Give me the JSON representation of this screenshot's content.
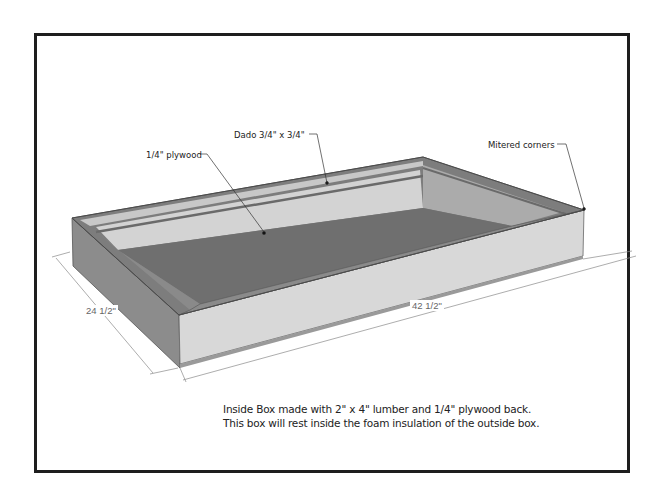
{
  "diagram": {
    "type": "3d-box-sketch",
    "subject": "Inside box",
    "colors": {
      "frame": "#1e1e1e",
      "floor": "#6e6e6e",
      "inner_wall_light": "#d2d2d2",
      "inner_wall_right": "#a9a9a9",
      "outer_front_face": "#d6d6d6",
      "outer_left_face": "#8a8a8a",
      "rim": "#7a7a7a",
      "dimension_line": "#777777"
    },
    "callouts": [
      {
        "id": "plywood",
        "text": "1/4\" plywood"
      },
      {
        "id": "dado",
        "text": "Dado 3/4\" x 3/4\""
      },
      {
        "id": "mitered",
        "text": "Mitered corners"
      }
    ],
    "dimensions": {
      "width": "24 1/2\"",
      "length": "42 1/2\""
    },
    "caption": {
      "line1": "Inside Box made with 2\" x 4\" lumber and 1/4\" plywood back.",
      "line2": "This box will rest inside the foam insulation of the outside box."
    }
  }
}
